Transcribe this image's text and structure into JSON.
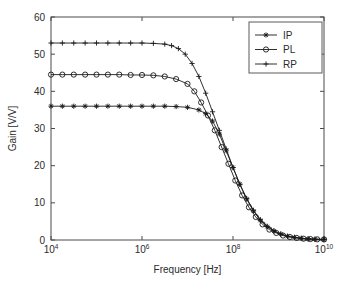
{
  "chart_data": {
    "type": "line",
    "title": "",
    "xlabel": "Frequency [Hz]",
    "ylabel": "Gain [V/V]",
    "xscale": "log",
    "yscale": "linear",
    "xlim": [
      10000,
      10000000000
    ],
    "ylim": [
      0,
      60
    ],
    "xticks": [
      10000,
      1000000,
      100000000,
      10000000000
    ],
    "xtick_labels": [
      "10^4",
      "10^6",
      "10^8",
      "10^10"
    ],
    "xtick_mantissa": [
      "10",
      "10",
      "10",
      "10"
    ],
    "xtick_exponent": [
      "4",
      "6",
      "8",
      "10"
    ],
    "yticks": [
      0,
      10,
      20,
      30,
      40,
      50,
      60
    ],
    "ytick_labels": [
      "0",
      "10",
      "20",
      "30",
      "40",
      "50",
      "60"
    ],
    "grid": false,
    "legend_position": "upper right",
    "series": [
      {
        "name": "IP",
        "marker": "star-icon",
        "marker_filled": true,
        "plateau": 36.0,
        "x": [
          10000,
          17782794,
          31622777,
          56234133,
          100000000,
          177827941,
          316227766,
          562341325,
          1000000000,
          1778279410,
          3162277660,
          5623413252,
          10000000000,
          14677993,
          21544347,
          31622777,
          46415888,
          68129207,
          100000000
        ],
        "points": [
          [
            4.0,
            36.0
          ],
          [
            4.25,
            36.0
          ],
          [
            4.5,
            36.0
          ],
          [
            4.75,
            36.0
          ],
          [
            5.0,
            36.0
          ],
          [
            5.25,
            36.0
          ],
          [
            5.5,
            36.0
          ],
          [
            5.75,
            36.0
          ],
          [
            6.0,
            36.0
          ],
          [
            6.25,
            36.0
          ],
          [
            6.5,
            36.0
          ],
          [
            6.75,
            35.9
          ],
          [
            7.0,
            35.7
          ],
          [
            7.25,
            35.0
          ],
          [
            7.4,
            34.0
          ],
          [
            7.55,
            32.0
          ],
          [
            7.7,
            28.5
          ],
          [
            7.85,
            24.0
          ],
          [
            8.0,
            19.5
          ],
          [
            8.15,
            15.0
          ],
          [
            8.3,
            11.0
          ],
          [
            8.45,
            7.8
          ],
          [
            8.6,
            5.3
          ],
          [
            8.75,
            3.6
          ],
          [
            8.9,
            2.4
          ],
          [
            9.05,
            1.6
          ],
          [
            9.2,
            1.0
          ],
          [
            9.35,
            0.7
          ],
          [
            9.5,
            0.45
          ],
          [
            9.65,
            0.3
          ],
          [
            9.8,
            0.2
          ],
          [
            10.0,
            0.15
          ]
        ]
      },
      {
        "name": "PL",
        "marker": "circle-icon",
        "marker_filled": false,
        "plateau": 44.5,
        "points": [
          [
            4.0,
            44.5
          ],
          [
            4.25,
            44.5
          ],
          [
            4.5,
            44.5
          ],
          [
            4.75,
            44.5
          ],
          [
            5.0,
            44.5
          ],
          [
            5.25,
            44.5
          ],
          [
            5.5,
            44.5
          ],
          [
            5.75,
            44.4
          ],
          [
            6.0,
            44.4
          ],
          [
            6.25,
            44.3
          ],
          [
            6.5,
            44.0
          ],
          [
            6.75,
            43.3
          ],
          [
            7.0,
            42.0
          ],
          [
            7.15,
            40.0
          ],
          [
            7.3,
            37.0
          ],
          [
            7.45,
            33.5
          ],
          [
            7.6,
            29.5
          ],
          [
            7.75,
            25.0
          ],
          [
            7.9,
            20.5
          ],
          [
            8.05,
            16.0
          ],
          [
            8.2,
            12.0
          ],
          [
            8.35,
            8.8
          ],
          [
            8.5,
            6.2
          ],
          [
            8.65,
            4.2
          ],
          [
            8.8,
            2.8
          ],
          [
            8.95,
            1.9
          ],
          [
            9.1,
            1.2
          ],
          [
            9.25,
            0.8
          ],
          [
            9.4,
            0.55
          ],
          [
            9.55,
            0.35
          ],
          [
            9.7,
            0.25
          ],
          [
            9.85,
            0.18
          ],
          [
            10.0,
            0.15
          ]
        ]
      },
      {
        "name": "RP",
        "marker": "plus-icon",
        "marker_filled": false,
        "plateau": 53.0,
        "points": [
          [
            4.0,
            53.0
          ],
          [
            4.25,
            53.0
          ],
          [
            4.5,
            53.0
          ],
          [
            4.75,
            53.0
          ],
          [
            5.0,
            53.0
          ],
          [
            5.25,
            53.0
          ],
          [
            5.5,
            53.0
          ],
          [
            5.75,
            53.0
          ],
          [
            6.0,
            53.0
          ],
          [
            6.25,
            52.9
          ],
          [
            6.5,
            52.7
          ],
          [
            6.65,
            52.3
          ],
          [
            6.8,
            51.5
          ],
          [
            6.95,
            50.0
          ],
          [
            7.1,
            47.5
          ],
          [
            7.25,
            44.0
          ],
          [
            7.4,
            39.5
          ],
          [
            7.55,
            34.5
          ],
          [
            7.7,
            29.5
          ],
          [
            7.85,
            24.5
          ],
          [
            8.0,
            19.5
          ],
          [
            8.15,
            15.0
          ],
          [
            8.3,
            11.2
          ],
          [
            8.45,
            8.0
          ],
          [
            8.6,
            5.5
          ],
          [
            8.75,
            3.7
          ],
          [
            8.9,
            2.5
          ],
          [
            9.05,
            1.6
          ],
          [
            9.2,
            1.0
          ],
          [
            9.35,
            0.7
          ],
          [
            9.5,
            0.45
          ],
          [
            9.65,
            0.3
          ],
          [
            9.8,
            0.2
          ],
          [
            10.0,
            0.15
          ]
        ]
      }
    ]
  },
  "legend": {
    "entries": [
      {
        "label": "IP"
      },
      {
        "label": "PL"
      },
      {
        "label": "RP"
      }
    ]
  }
}
